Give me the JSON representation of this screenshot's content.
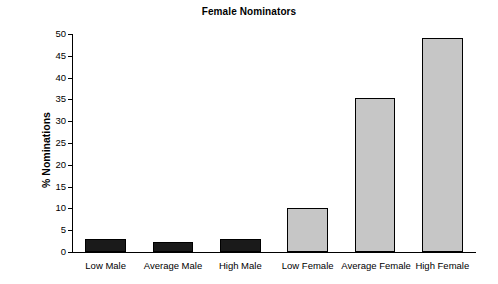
{
  "chart_data": {
    "type": "bar",
    "title": "Female Nominators",
    "xlabel": "",
    "ylabel": "% Nominations",
    "categories": [
      "Low Male",
      "Average Male",
      "High Male",
      "Low Female",
      "Average Female",
      "High Female"
    ],
    "values": [
      3.0,
      2.3,
      3.0,
      10.1,
      35.3,
      49.2
    ],
    "bar_colors": [
      "#1a1a1a",
      "#1a1a1a",
      "#1a1a1a",
      "#c6c6c6",
      "#c6c6c6",
      "#c6c6c6"
    ],
    "ylim": [
      0,
      50
    ],
    "yticks": [
      0,
      5,
      10,
      15,
      20,
      25,
      30,
      35,
      40,
      45,
      50
    ],
    "ytick_labels": [
      "0",
      "5",
      "10",
      "15",
      "20",
      "25",
      "30",
      "35",
      "40",
      "45",
      "50"
    ],
    "grid": false,
    "legend": null,
    "axis_color": "#000000",
    "background": "#ffffff"
  }
}
